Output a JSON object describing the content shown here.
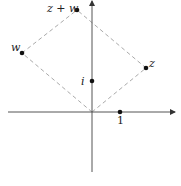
{
  "diagram": {
    "type": "complex-plane-parallelogram",
    "colors": {
      "axis": "#555555",
      "dashed": "#aaaaaa",
      "point": "#111111",
      "label": "#222222"
    },
    "points": {
      "origin": {
        "x": 92,
        "y": 112
      },
      "one": {
        "label": "1",
        "x": 120,
        "y": 112
      },
      "i": {
        "label": "i",
        "x": 92,
        "y": 81
      },
      "z": {
        "label": "z",
        "x": 146,
        "y": 68
      },
      "w": {
        "label": "w",
        "x": 22,
        "y": 53
      },
      "zw": {
        "label": "z + w",
        "x": 77,
        "y": 10
      }
    }
  }
}
